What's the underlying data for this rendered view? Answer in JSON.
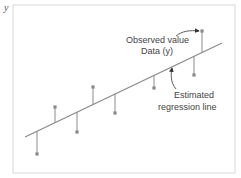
{
  "diagram": {
    "axis_label_y": "y",
    "annotations": {
      "observed_line1": "Observed value",
      "observed_line2": "Data (y)",
      "regression_line1": "Estimated",
      "regression_line2": "regression line"
    },
    "colors": {
      "frame": "#d8d8d8",
      "line": "#8a8a8a",
      "point": "#8a8a8a",
      "text": "#444444"
    },
    "regression_line": {
      "x1": 25,
      "y1": 137,
      "x2": 222,
      "y2": 43
    },
    "points": [
      {
        "x": 37,
        "line_y": 131,
        "obs_y": 154
      },
      {
        "x": 55,
        "line_y": 123,
        "obs_y": 107
      },
      {
        "x": 77,
        "line_y": 112,
        "obs_y": 132
      },
      {
        "x": 93,
        "line_y": 105,
        "obs_y": 87
      },
      {
        "x": 115,
        "line_y": 94,
        "obs_y": 113
      },
      {
        "x": 154,
        "line_y": 76,
        "obs_y": 88
      },
      {
        "x": 194,
        "line_y": 57,
        "obs_y": 75
      },
      {
        "x": 202,
        "line_y": 53,
        "obs_y": 31
      }
    ]
  }
}
